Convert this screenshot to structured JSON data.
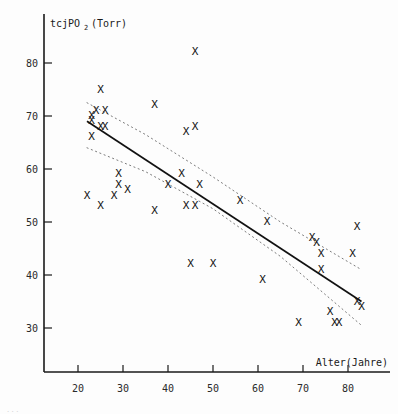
{
  "figure": {
    "background": "#fdfdfd",
    "ink_color": "#141414",
    "marker_glyph": "X",
    "bottom_caption": "..."
  },
  "chart_data": {
    "type": "scatter",
    "title": "",
    "subtitle": "",
    "xlabel": "Alter(Jahre)",
    "ylabel": "tcjPO2 (Torr)",
    "ylabel_main": "tcjPO",
    "ylabel_sub": "2",
    "ylabel_unit": "(Torr)",
    "xlim": [
      16,
      86
    ],
    "ylim": [
      24,
      86
    ],
    "xticks": [
      20,
      30,
      40,
      50,
      60,
      70,
      80
    ],
    "yticks": [
      30,
      40,
      50,
      60,
      70,
      80
    ],
    "xticklabels": [
      "20",
      "30",
      "40",
      "50",
      "60",
      "70",
      "80"
    ],
    "yticklabels": [
      "30",
      "40",
      "50",
      "60",
      "70",
      "80"
    ],
    "grid": false,
    "legend": "none",
    "points": [
      {
        "x": 23,
        "y": 70
      },
      {
        "x": 23,
        "y": 69
      },
      {
        "x": 23,
        "y": 66
      },
      {
        "x": 24,
        "y": 71
      },
      {
        "x": 25,
        "y": 75
      },
      {
        "x": 26,
        "y": 71
      },
      {
        "x": 25,
        "y": 68
      },
      {
        "x": 26,
        "y": 68
      },
      {
        "x": 22,
        "y": 55
      },
      {
        "x": 25,
        "y": 53
      },
      {
        "x": 28,
        "y": 55
      },
      {
        "x": 29,
        "y": 59
      },
      {
        "x": 29,
        "y": 57
      },
      {
        "x": 31,
        "y": 56
      },
      {
        "x": 37,
        "y": 72
      },
      {
        "x": 37,
        "y": 52
      },
      {
        "x": 40,
        "y": 57
      },
      {
        "x": 43,
        "y": 59
      },
      {
        "x": 44,
        "y": 67
      },
      {
        "x": 46,
        "y": 68
      },
      {
        "x": 46,
        "y": 82
      },
      {
        "x": 44,
        "y": 53
      },
      {
        "x": 46,
        "y": 53
      },
      {
        "x": 47,
        "y": 57
      },
      {
        "x": 45,
        "y": 42
      },
      {
        "x": 50,
        "y": 42
      },
      {
        "x": 56,
        "y": 54
      },
      {
        "x": 61,
        "y": 39
      },
      {
        "x": 62,
        "y": 50
      },
      {
        "x": 69,
        "y": 31
      },
      {
        "x": 72,
        "y": 47
      },
      {
        "x": 73,
        "y": 46
      },
      {
        "x": 74,
        "y": 44
      },
      {
        "x": 74,
        "y": 41
      },
      {
        "x": 76,
        "y": 33
      },
      {
        "x": 77,
        "y": 31
      },
      {
        "x": 78,
        "y": 31
      },
      {
        "x": 82,
        "y": 49
      },
      {
        "x": 82,
        "y": 35
      },
      {
        "x": 83,
        "y": 34
      },
      {
        "x": 81,
        "y": 44
      }
    ],
    "regression_line": {
      "label": "",
      "x_start": 22,
      "y_start": 69,
      "x_end": 83,
      "y_end": 35
    },
    "confidence_band_upper": {
      "label": "",
      "points": [
        [
          22,
          72.5
        ],
        [
          35,
          66.5
        ],
        [
          50,
          58.5
        ],
        [
          65,
          50.0
        ],
        [
          83,
          41.0
        ]
      ]
    },
    "confidence_band_lower": {
      "label": "",
      "points": [
        [
          22,
          64.0
        ],
        [
          35,
          59.5
        ],
        [
          50,
          52.5
        ],
        [
          65,
          43.5
        ],
        [
          83,
          30.5
        ]
      ]
    }
  }
}
